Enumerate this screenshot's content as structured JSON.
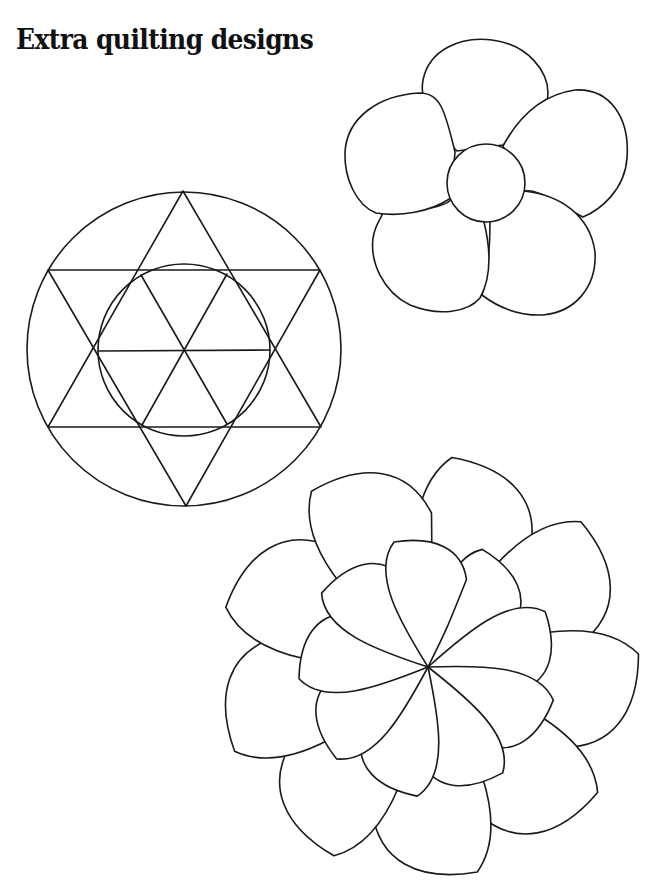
{
  "page": {
    "title": "Extra quilting designs",
    "background_color": "#ffffff",
    "line_color": "#1a1a1a"
  },
  "designs": [
    {
      "id": "five-petal-flower",
      "description": "Five rounded petals around a central circle",
      "petal_count": 5,
      "center": [
        486,
        183
      ],
      "center_circle_radius": 39
    },
    {
      "id": "star-in-circle",
      "description": "Six-pointed star (hexagram) inscribed in a circle with an inner circle through the star's inner vertices",
      "center": [
        184,
        349
      ],
      "outer_radius": 157,
      "inner_radius": 86,
      "star_points": 6
    },
    {
      "id": "swirl-flower",
      "description": "Pinwheel flower of curved teardrop petals spiraling from a central point, outer and inner rings",
      "center": [
        428,
        667
      ],
      "outer_petal_count": 9,
      "inner_petal_count": 9
    }
  ]
}
